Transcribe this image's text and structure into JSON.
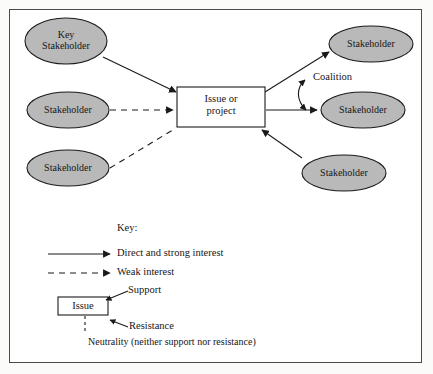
{
  "diagram": {
    "colors": {
      "page_background": "#fbfbf9",
      "frame_background": "#ffffff",
      "frame_border": "#4a4a4a",
      "ellipse_fill": "#b9b9b9",
      "ellipse_stroke": "#1a1a1a",
      "box_fill": "#ffffff",
      "box_stroke": "#1a1a1a",
      "line": "#1a1a1a",
      "text": "#161616"
    },
    "center": {
      "label": "Issue or\nproject",
      "line1": "Issue or",
      "line2": "project"
    },
    "stakeholders": [
      {
        "id": "key-stakeholder-top-left",
        "label": "Key\nStakeholder",
        "line1": "Key",
        "line2": "Stakeholder",
        "position": "top-left",
        "link": "direct-and-strong-interest"
      },
      {
        "id": "stakeholder-mid-left",
        "label": "Stakeholder",
        "position": "middle-left",
        "link": "weak-interest"
      },
      {
        "id": "stakeholder-bottom-left",
        "label": "Stakeholder",
        "position": "bottom-left",
        "link": "weak-interest"
      },
      {
        "id": "stakeholder-top-right",
        "label": "Stakeholder",
        "position": "top-right",
        "link": "direct-and-strong-interest"
      },
      {
        "id": "stakeholder-mid-right",
        "label": "Stakeholder",
        "position": "middle-right",
        "link": "direct-and-strong-interest"
      },
      {
        "id": "stakeholder-bottom-right",
        "label": "Stakeholder",
        "position": "bottom-right",
        "link": "direct-and-strong-interest"
      }
    ],
    "annotations": [
      {
        "id": "coalition",
        "label": "Coalition",
        "between": [
          "stakeholder-top-right",
          "stakeholder-mid-right"
        ]
      }
    ]
  },
  "key": {
    "heading": "Key:",
    "entries": [
      {
        "id": "direct-and-strong-interest",
        "label": "Direct and strong interest",
        "line_style": "solid",
        "arrow": true
      },
      {
        "id": "weak-interest",
        "label": "Weak interest",
        "line_style": "dashed",
        "arrow": true
      }
    ],
    "issue_example": {
      "box_label": "Issue",
      "support_label": "Support",
      "resistance_label": "Resistance",
      "neutrality_label": "Neutrality (neither support nor resistance)"
    }
  }
}
